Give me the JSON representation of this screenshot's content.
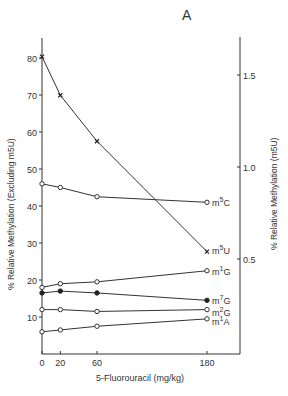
{
  "panel_label": "A",
  "chart_data": {
    "type": "line",
    "title": "A",
    "xlabel": "5-Fluorouracil (mg/kg)",
    "ylabel_left": "% Relative Methylation (Excluding m5U)",
    "ylabel_right": "% Relative Methylation (m5U)",
    "x": [
      0,
      20,
      60,
      180
    ],
    "x_ticks": [
      "0",
      "20",
      "60",
      "180"
    ],
    "y_left_ticks": [
      "10",
      "20",
      "30",
      "40",
      "50",
      "60",
      "70",
      "80"
    ],
    "y_right_ticks": [
      "0.5",
      "1.0",
      "1.5"
    ],
    "ylim_left": [
      0,
      85
    ],
    "ylim_right": [
      0,
      1.7
    ],
    "grid": false,
    "legend_position": "inline labels at right end of each series",
    "series": [
      {
        "name": "m5U",
        "axis": "right",
        "marker": "x",
        "values": [
          1.6,
          1.39,
          1.14,
          0.54
        ]
      },
      {
        "name": "m5C",
        "axis": "left",
        "marker": "open-circle",
        "values": [
          46,
          45,
          42.5,
          41
        ]
      },
      {
        "name": "m1G",
        "axis": "left",
        "marker": "open-circle",
        "values": [
          18,
          19,
          19.5,
          22.5
        ]
      },
      {
        "name": "m7G",
        "axis": "left",
        "marker": "filled-circle",
        "values": [
          16.5,
          17,
          16.5,
          14.5
        ]
      },
      {
        "name": "m2G",
        "axis": "left",
        "marker": "open-circle",
        "values": [
          12,
          12,
          11.5,
          12
        ]
      },
      {
        "name": "m1A",
        "axis": "left",
        "marker": "open-circle",
        "values": [
          6,
          6.5,
          7.5,
          9.5
        ]
      }
    ]
  },
  "labels": {
    "m5U": {
      "base": "m",
      "sup": "5",
      "tail": "U"
    },
    "m5C": {
      "base": "m",
      "sup": "5",
      "tail": "C"
    },
    "m1G": {
      "base": "m",
      "sup": "1",
      "tail": "G"
    },
    "m7G": {
      "base": "m",
      "sup": "7",
      "tail": "G"
    },
    "m2G": {
      "base": "m",
      "sup": "2",
      "tail": "G"
    },
    "m1A": {
      "base": "m",
      "sup": "1",
      "tail": "A"
    }
  },
  "ylabel_left_text": "% Relative Methylation (Excluding m5U)",
  "ylabel_right_text": "% Relative Methylation (m5U)",
  "xlabel_text": "5-Fluorouracil (mg/kg)",
  "cutoff_caption": "Fig. ... relative methylation of ... tRNA ..."
}
